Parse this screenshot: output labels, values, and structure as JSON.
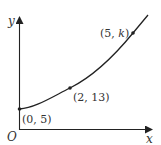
{
  "diagram": {
    "type": "function-graph",
    "axes": {
      "x_label": "x",
      "y_label": "y",
      "origin_label": "O"
    },
    "points": [
      {
        "label": "(0, 5)",
        "x": 0,
        "y": 5
      },
      {
        "label": "(2, 13)",
        "x": 2,
        "y": 13
      },
      {
        "label_prefix": "(5, ",
        "label_var": "k",
        "label_suffix": ")",
        "x": 5,
        "y": "k"
      }
    ],
    "colors": {
      "line": "#222222",
      "text": "#333333",
      "background": "#ffffff"
    }
  }
}
